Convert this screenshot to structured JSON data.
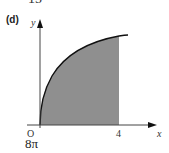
{
  "page_fragment": {
    "top_number_partial": "15",
    "part_label": "(d)",
    "answer": "8π"
  },
  "figure": {
    "axis_labels": {
      "x": "x",
      "y": "y",
      "origin": "O"
    },
    "x_tick_label": "4",
    "curve": "increasing concave curve from origin, shaded region under curve from x=0 to x=4",
    "shade_color": "#8f8f8f",
    "line_color": "#111111"
  }
}
